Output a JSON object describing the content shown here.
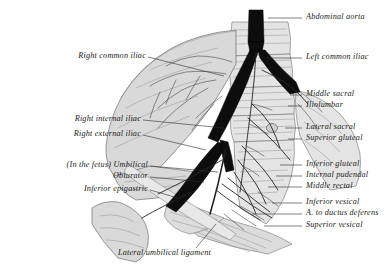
{
  "figure": {
    "kind": "anatomical-engraving",
    "style": "grayscale halftone engraving on white ground",
    "background_color": "#ffffff",
    "ink_color": "#1a1a1a",
    "bone_tone": "#d9d9d9",
    "vessel_tone": "#0d0d0d"
  },
  "labels": {
    "right_side": [
      {
        "id": "abdominal-aorta",
        "text": "Abdominal aorta"
      },
      {
        "id": "left-common-iliac",
        "text": "Left common iliac"
      },
      {
        "id": "middle-sacral",
        "text": "Middle sacral"
      },
      {
        "id": "iliolumbar",
        "text": "Iliolumbar"
      },
      {
        "id": "lateral-sacral",
        "text": "Lateral sacral"
      },
      {
        "id": "superior-gluteal",
        "text": "Superior gluteal"
      },
      {
        "id": "inferior-gluteal",
        "text": "Inferior gluteal"
      },
      {
        "id": "internal-pudendal",
        "text": "Internal pudendal"
      },
      {
        "id": "middle-rectal",
        "text": "Middle rectal"
      },
      {
        "id": "inferior-vesical",
        "text": "Inferior vesical"
      },
      {
        "id": "artery-to-ductus-deferens",
        "text": "A. to ductus deferens"
      },
      {
        "id": "superior-vesical",
        "text": "Superior vesical"
      }
    ],
    "left_side": [
      {
        "id": "right-common-iliac",
        "text": "Right common iliac"
      },
      {
        "id": "right-internal-iliac",
        "text": "Right internal iliac"
      },
      {
        "id": "right-external-iliac",
        "text": "Right external iliac"
      },
      {
        "id": "umbilical",
        "text": "(In the fetus) Umbilical"
      },
      {
        "id": "obturator",
        "text": "Obturator"
      },
      {
        "id": "inferior-epigastric",
        "text": "Inferior epigastric"
      }
    ],
    "bottom": [
      {
        "id": "lateral-umbilical-ligament",
        "text": "Lateral umbilical ligament"
      }
    ]
  }
}
